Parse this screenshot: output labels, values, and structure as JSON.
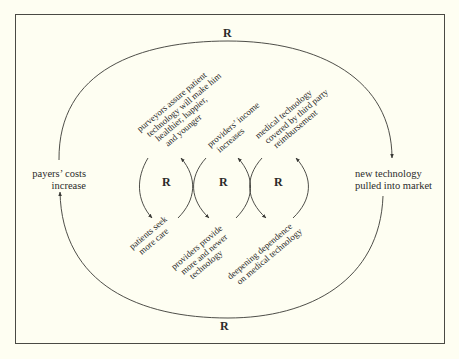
{
  "diagram": {
    "type": "causal-loop",
    "outer_loop_top_label": "R",
    "outer_loop_bottom_label": "R",
    "nodes": {
      "left": {
        "lines": [
          "payers’ costs",
          "increase"
        ]
      },
      "right": {
        "lines": [
          "new technology",
          "pulled into market"
        ]
      }
    },
    "inner_loops": [
      {
        "label": "R"
      },
      {
        "label": "R"
      },
      {
        "label": "R"
      }
    ],
    "upper_labels": [
      {
        "lines": [
          "purveyors assure patient",
          "technology will make him",
          "healthier, happier,",
          "and younger"
        ]
      },
      {
        "lines": [
          "providers’ income",
          "increases"
        ]
      },
      {
        "lines": [
          "medical technology",
          "covered by third party",
          "reimbursement"
        ]
      }
    ],
    "lower_labels": [
      {
        "lines": [
          "patients seek",
          "more care"
        ]
      },
      {
        "lines": [
          "providers provide",
          "more and newer",
          "technology"
        ]
      },
      {
        "lines": [
          "deepening dependence",
          "on medical technology"
        ]
      }
    ],
    "colors": {
      "background": "#fefef2",
      "stroke": "#3a3a36",
      "text": "#2a2a2a"
    }
  }
}
